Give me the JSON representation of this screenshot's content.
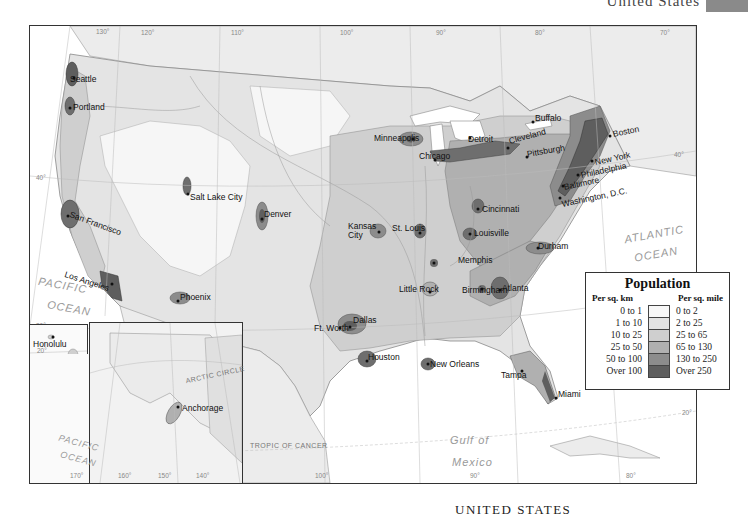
{
  "header": {
    "title": "United States",
    "tab_color": "#8a8a8a"
  },
  "footer": {
    "title": "UNITED STATES"
  },
  "legend": {
    "title": "Population",
    "col_left_header": "Per sq. km",
    "col_right_header": "Per sq. mile",
    "rows": [
      {
        "km": "0 to 1",
        "mile": "0 to 2",
        "color": "#f7f7f7"
      },
      {
        "km": "1 to 10",
        "mile": "2 to 25",
        "color": "#e3e3e3"
      },
      {
        "km": "10 to 25",
        "mile": "25 to 65",
        "color": "#cfcfcf"
      },
      {
        "km": "25 to 50",
        "mile": "65 to 130",
        "color": "#b0b0b0"
      },
      {
        "km": "50 to 100",
        "mile": "130 to 250",
        "color": "#8c8c8c"
      },
      {
        "km": "Over 100",
        "mile": "Over 250",
        "color": "#5e5e5e"
      }
    ]
  },
  "cities": [
    {
      "name": "Seattle",
      "x": 70,
      "y": 56
    },
    {
      "name": "Portland",
      "x": 66,
      "y": 80
    },
    {
      "name": "San Francisco",
      "x": 43,
      "y": 188
    },
    {
      "name": "Los Angeles",
      "x": 36,
      "y": 246
    },
    {
      "name": "Phoenix",
      "x": 148,
      "y": 268
    },
    {
      "name": "Salt Lake City",
      "x": 160,
      "y": 170
    },
    {
      "name": "Denver",
      "x": 232,
      "y": 185
    },
    {
      "name": "Minneapolis",
      "x": 344,
      "y": 107
    },
    {
      "name": "Chicago",
      "x": 389,
      "y": 124
    },
    {
      "name": "Detroit",
      "x": 438,
      "y": 110
    },
    {
      "name": "Cleveland",
      "x": 480,
      "y": 110
    },
    {
      "name": "Buffalo",
      "x": 505,
      "y": 87
    },
    {
      "name": "Pittsburgh",
      "x": 497,
      "y": 123
    },
    {
      "name": "Boston",
      "x": 583,
      "y": 105
    },
    {
      "name": "New York",
      "x": 565,
      "y": 133
    },
    {
      "name": "Philadelphia",
      "x": 550,
      "y": 146
    },
    {
      "name": "Baltimore",
      "x": 532,
      "y": 158
    },
    {
      "name": "Washington, D.C.",
      "x": 530,
      "y": 173
    },
    {
      "name": "Cincinnati",
      "x": 452,
      "y": 182
    },
    {
      "name": "Louisville",
      "x": 449,
      "y": 204
    },
    {
      "name": "Kansas City",
      "x": 320,
      "y": 198
    },
    {
      "name": "St. Louis",
      "x": 390,
      "y": 196
    },
    {
      "name": "Durham",
      "x": 508,
      "y": 219
    },
    {
      "name": "Memphis",
      "x": 430,
      "y": 229
    },
    {
      "name": "Little Rock",
      "x": 369,
      "y": 258
    },
    {
      "name": "Birmingham",
      "x": 432,
      "y": 258
    },
    {
      "name": "Atlanta",
      "x": 488,
      "y": 258
    },
    {
      "name": "Dallas",
      "x": 322,
      "y": 291
    },
    {
      "name": "Ft. Worth",
      "x": 285,
      "y": 297
    },
    {
      "name": "Houston",
      "x": 337,
      "y": 328
    },
    {
      "name": "New Orleans",
      "x": 398,
      "y": 335
    },
    {
      "name": "Tampa",
      "x": 476,
      "y": 347
    },
    {
      "name": "Miami",
      "x": 527,
      "y": 365
    }
  ],
  "inset_cities": [
    {
      "name": "Honolulu"
    },
    {
      "name": "Anchorage"
    }
  ],
  "water_labels": [
    {
      "name": "PACIFIC",
      "x": 8,
      "y": 255
    },
    {
      "name": "OCEAN",
      "x": 17,
      "y": 278
    },
    {
      "name": "ATLANTIC",
      "x": 594,
      "y": 204
    },
    {
      "name": "OCEAN",
      "x": 604,
      "y": 224
    },
    {
      "name": "Gulf of",
      "x": 420,
      "y": 400
    },
    {
      "name": "Mexico",
      "x": 422,
      "y": 423
    }
  ],
  "inset_water_labels": [
    {
      "name": "PACIFIC"
    },
    {
      "name": "OCEAN"
    }
  ],
  "graticule_labels": {
    "top": [
      "130°",
      "120°",
      "110°",
      "100°",
      "90°",
      "80°",
      "70°"
    ],
    "bottom": [
      "100°",
      "90°",
      "80°"
    ],
    "bottom_inset": [
      "170°",
      "160°",
      "150°",
      "140°"
    ],
    "lat": [
      "40°",
      "30°",
      "20°"
    ],
    "arctic_circle": "ARCTIC CIRCLE",
    "tropic_of_cancer": "TROPIC OF CANCER",
    "inset_lat": [
      "60°",
      "65°",
      "70°"
    ],
    "hawaii": [
      "20°",
      "160°"
    ]
  }
}
